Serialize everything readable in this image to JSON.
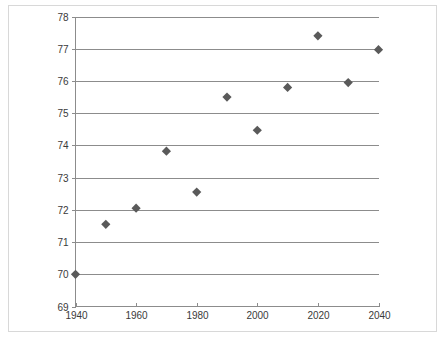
{
  "figure": {
    "background_color": "#ffffff",
    "frame_color": "#d8d8d8",
    "axis_color": "#8c8c8c",
    "grid_color": "#8c8c8c",
    "marker_color": "#5a5a5a",
    "tick_text_color": "#3a3a3a"
  },
  "chart_data": {
    "type": "scatter",
    "title": "",
    "subtitle": "",
    "xlabel": "",
    "ylabel": "",
    "xlim": [
      1940,
      2040
    ],
    "ylim": [
      69,
      78
    ],
    "grid": true,
    "grid_axis": "y",
    "legend": false,
    "legend_position": "none",
    "marker_shape": "diamond",
    "x": [
      1940,
      1950,
      1960,
      1970,
      1980,
      1990,
      2000,
      2010,
      2020,
      2030,
      2040
    ],
    "y": [
      70.0,
      71.55,
      72.05,
      73.82,
      72.55,
      75.5,
      74.47,
      75.8,
      77.4,
      75.95,
      76.97
    ],
    "points": [
      {
        "x": 1940,
        "y": 70.0
      },
      {
        "x": 1950,
        "y": 71.55
      },
      {
        "x": 1960,
        "y": 72.05
      },
      {
        "x": 1970,
        "y": 73.82
      },
      {
        "x": 1980,
        "y": 72.55
      },
      {
        "x": 1990,
        "y": 75.5
      },
      {
        "x": 2000,
        "y": 74.47
      },
      {
        "x": 2010,
        "y": 75.8
      },
      {
        "x": 2020,
        "y": 77.4
      },
      {
        "x": 2030,
        "y": 75.95
      },
      {
        "x": 2040,
        "y": 76.97
      }
    ],
    "y_ticks": [
      69,
      70,
      71,
      72,
      73,
      74,
      75,
      76,
      77,
      78
    ],
    "y_tick_labels": [
      "69",
      "70",
      "71",
      "72",
      "73",
      "74",
      "75",
      "76",
      "77",
      "78"
    ],
    "x_ticks": [
      1940,
      1960,
      1980,
      2000,
      2020,
      2040
    ],
    "x_tick_labels": [
      "1940",
      "1960",
      "1980",
      "2000",
      "2020",
      "2040"
    ],
    "annotations": []
  }
}
